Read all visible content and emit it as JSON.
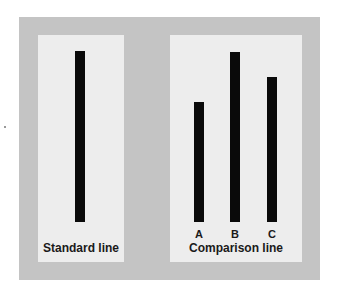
{
  "figure": {
    "standard_panel": {
      "caption": "Standard line",
      "bar_top": 51,
      "bar_bottom": 222
    },
    "comparison_panel": {
      "caption": "Comparison line",
      "lines": [
        {
          "label": "A",
          "bar_top": 102,
          "bar_bottom": 222
        },
        {
          "label": "B",
          "bar_top": 52,
          "bar_bottom": 222
        },
        {
          "label": "C",
          "bar_top": 77,
          "bar_bottom": 222
        }
      ]
    },
    "colors": {
      "outer_bg": "#c4c4c4",
      "panel_bg": "#ededed",
      "bar": "#0a0a0a"
    }
  }
}
